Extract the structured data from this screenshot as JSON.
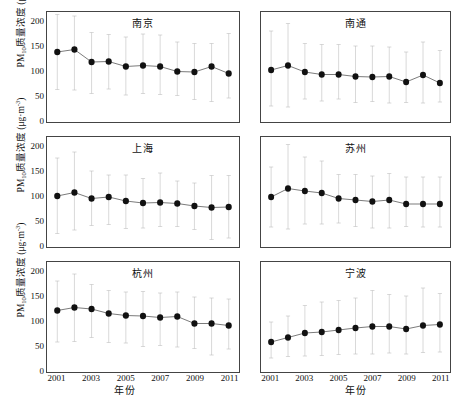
{
  "figure": {
    "axis": {
      "y_title_main": "PM",
      "y_title_sub": "10",
      "y_title_rest": "质量浓度 (μg·m",
      "y_title_sup": "-3",
      "y_title_close": ")",
      "x_title": "年份",
      "y_ticks": [
        "0",
        "50",
        "100",
        "150",
        "200"
      ],
      "x_ticks": [
        "2001",
        "2003",
        "2005",
        "2007",
        "2009",
        "2011"
      ]
    }
  },
  "chart_data": {
    "type": "line",
    "title": "",
    "xlabel": "年份",
    "ylabel": "PM10质量浓度 (μg·m-3)",
    "xlim": [
      2000.4,
      2011.6
    ],
    "ylim": [
      0,
      220
    ],
    "yticks": [
      0,
      50,
      100,
      150,
      200
    ],
    "xticks": [
      2001,
      2003,
      2005,
      2007,
      2009,
      2011
    ],
    "grid": false,
    "legend": "none",
    "error_bars": "range (min-max whiskers)",
    "marker": "filled circle",
    "x": [
      2001,
      2002,
      2003,
      2004,
      2005,
      2006,
      2007,
      2008,
      2009,
      2010,
      2011
    ],
    "panels": [
      {
        "name": "南京",
        "row": 0,
        "col": 0,
        "values": [
          140,
          145,
          120,
          121,
          111,
          113,
          111,
          101,
          100,
          111,
          97
        ],
        "err_low": [
          65,
          64,
          57,
          66,
          54,
          57,
          55,
          53,
          45,
          41,
          48,
          40
        ],
        "err_high": [
          215,
          212,
          179,
          175,
          170,
          176,
          174,
          160,
          157,
          157,
          177,
          150
        ]
      },
      {
        "name": "南通",
        "row": 0,
        "col": 1,
        "values": [
          104,
          113,
          100,
          95,
          95,
          91,
          90,
          91,
          80,
          94,
          78
        ],
        "err_low": [
          32,
          30,
          46,
          42,
          46,
          39,
          41,
          38,
          39,
          38,
          40
        ],
        "err_high": [
          182,
          197,
          157,
          155,
          155,
          152,
          152,
          150,
          140,
          160,
          143
        ]
      },
      {
        "name": "上海",
        "row": 1,
        "col": 0,
        "values": [
          102,
          109,
          97,
          100,
          92,
          88,
          89,
          87,
          82,
          79,
          80
        ],
        "err_low": [
          27,
          34,
          43,
          45,
          37,
          38,
          41,
          41,
          35,
          15,
          18
        ],
        "err_high": [
          178,
          190,
          152,
          144,
          144,
          137,
          148,
          132,
          128,
          143,
          143
        ]
      },
      {
        "name": "苏州",
        "row": 1,
        "col": 1,
        "values": [
          100,
          117,
          112,
          108,
          97,
          94,
          91,
          94,
          86,
          86,
          86
        ],
        "err_low": [
          40,
          36,
          46,
          46,
          48,
          41,
          38,
          38,
          41,
          40,
          40
        ],
        "err_high": [
          160,
          205,
          180,
          172,
          145,
          145,
          142,
          147,
          140,
          140,
          140
        ]
      },
      {
        "name": "杭州",
        "row": 2,
        "col": 0,
        "values": [
          123,
          129,
          126,
          117,
          113,
          112,
          109,
          111,
          97,
          97,
          93
        ],
        "err_low": [
          60,
          61,
          69,
          59,
          58,
          51,
          53,
          50,
          47,
          34,
          46
        ],
        "err_high": [
          182,
          196,
          175,
          163,
          160,
          161,
          158,
          160,
          150,
          148,
          146
        ]
      },
      {
        "name": "宁波",
        "row": 2,
        "col": 1,
        "values": [
          60,
          69,
          78,
          80,
          84,
          88,
          91,
          91,
          86,
          93,
          95
        ],
        "err_low": [
          28,
          31,
          32,
          33,
          35,
          36,
          36,
          38,
          36,
          39,
          40
        ],
        "err_high": [
          100,
          112,
          133,
          140,
          143,
          148,
          163,
          155,
          152,
          168,
          157
        ]
      }
    ]
  }
}
